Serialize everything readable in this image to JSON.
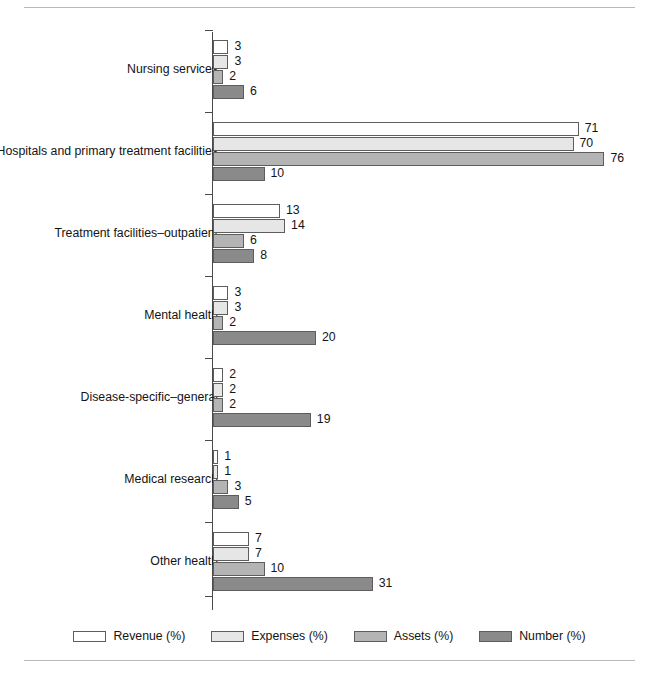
{
  "chart_data": {
    "type": "bar",
    "orientation": "horizontal",
    "title": "",
    "subtitle": "",
    "xlabel": "",
    "ylabel": "",
    "grid": false,
    "legend_position": "bottom",
    "xlim": [
      0,
      80
    ],
    "categories": [
      "Nursing services",
      "Hospitals and primary treatment facilities",
      "Treatment facilities–outpatient",
      "Mental health",
      "Disease-specific–general",
      "Medical research",
      "Other health"
    ],
    "series": [
      {
        "name": "Revenue (%)",
        "color": "#ffffff",
        "values": [
          3,
          71,
          13,
          3,
          2,
          1,
          7
        ]
      },
      {
        "name": "Expenses (%)",
        "color": "#e6e6e6",
        "values": [
          3,
          70,
          14,
          3,
          2,
          1,
          7
        ]
      },
      {
        "name": "Assets (%)",
        "color": "#b4b4b4",
        "values": [
          2,
          76,
          6,
          2,
          2,
          3,
          10
        ]
      },
      {
        "name": "Number (%)",
        "color": "#8a8a8a",
        "values": [
          6,
          10,
          8,
          20,
          19,
          5,
          31
        ]
      }
    ]
  },
  "legend": {
    "items": [
      {
        "label": "Revenue (%)"
      },
      {
        "label": "Expenses (%)"
      },
      {
        "label": "Assets (%)"
      },
      {
        "label": "Number (%)"
      }
    ]
  }
}
